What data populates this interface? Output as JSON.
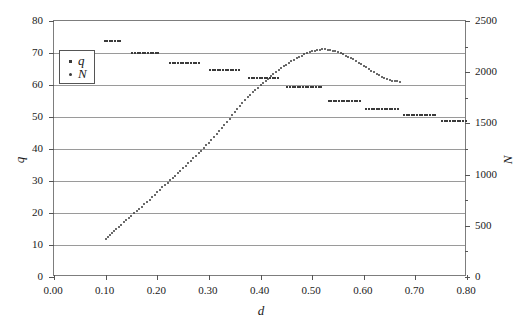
{
  "chart_data": {
    "type": "scatter",
    "title": "",
    "subtitle": "",
    "xlabel": "d",
    "ylabel": "q",
    "ylabel_right": "N",
    "xlim": [
      0.0,
      0.8
    ],
    "ylim": [
      0,
      80
    ],
    "ylim_right": [
      0,
      2500
    ],
    "grid": true,
    "legend_position": "top-left",
    "xticks": [
      "0.00",
      "0.10",
      "0.20",
      "0.30",
      "0.40",
      "0.50",
      "0.60",
      "0.70",
      "0.80"
    ],
    "xtick_values": [
      0.0,
      0.1,
      0.2,
      0.3,
      0.4,
      0.5,
      0.6,
      0.7,
      0.8
    ],
    "yticks_left": [
      "0",
      "10",
      "20",
      "30",
      "40",
      "50",
      "60",
      "70",
      "80"
    ],
    "ytick_values_left": [
      0,
      10,
      20,
      30,
      40,
      50,
      60,
      70,
      80
    ],
    "yticks_right": [
      "0",
      "500",
      "1000",
      "1500",
      "2000",
      "2500"
    ],
    "ytick_values_right": [
      0,
      500,
      1000,
      1500,
      2000,
      2500
    ],
    "ytick_minor_right": [
      250,
      750,
      1250,
      1750,
      2250
    ],
    "legend": [
      {
        "label": "q",
        "marker": "square",
        "axis": "left"
      },
      {
        "label": "N",
        "marker": "dot",
        "axis": "right"
      }
    ],
    "series": [
      {
        "name": "q",
        "marker": "dot",
        "axis": "left",
        "color": "#3a3a3a",
        "x": [
          0.1,
          0.104,
          0.108,
          0.112,
          0.116,
          0.12,
          0.125,
          0.13,
          0.135,
          0.14,
          0.145,
          0.15,
          0.155,
          0.16,
          0.165,
          0.17,
          0.175,
          0.18,
          0.185,
          0.19,
          0.195,
          0.2,
          0.205,
          0.21,
          0.215,
          0.22,
          0.225,
          0.23,
          0.235,
          0.24,
          0.245,
          0.25,
          0.255,
          0.26,
          0.265,
          0.27,
          0.275,
          0.28,
          0.285,
          0.29,
          0.295,
          0.3,
          0.305,
          0.31,
          0.315,
          0.32,
          0.325,
          0.33,
          0.335,
          0.34,
          0.345,
          0.35,
          0.355,
          0.36,
          0.365,
          0.37,
          0.375,
          0.38,
          0.385,
          0.39,
          0.395,
          0.4,
          0.405,
          0.41,
          0.415,
          0.42,
          0.425,
          0.43,
          0.435,
          0.44,
          0.445,
          0.45,
          0.455,
          0.46,
          0.465,
          0.47,
          0.475,
          0.48,
          0.485,
          0.49,
          0.495,
          0.5,
          0.505,
          0.51,
          0.515,
          0.52,
          0.525,
          0.53,
          0.535,
          0.54,
          0.545,
          0.55,
          0.555,
          0.56,
          0.565,
          0.57,
          0.575,
          0.58,
          0.585,
          0.59,
          0.595,
          0.6,
          0.605,
          0.61,
          0.615,
          0.62,
          0.625,
          0.63,
          0.635,
          0.64,
          0.645,
          0.65,
          0.655,
          0.66,
          0.665,
          0.67
        ],
        "y": [
          12.0,
          12.6,
          13.2,
          13.8,
          14.4,
          15.0,
          15.7,
          16.4,
          17.1,
          17.8,
          18.5,
          19.2,
          19.9,
          20.6,
          21.3,
          22.0,
          22.8,
          23.5,
          24.2,
          25.0,
          25.7,
          26.5,
          27.2,
          28.0,
          28.7,
          29.5,
          30.2,
          31.0,
          31.7,
          32.5,
          33.2,
          34.0,
          34.8,
          35.5,
          36.3,
          37.1,
          37.9,
          38.7,
          39.5,
          40.3,
          41.1,
          42.0,
          42.9,
          43.8,
          44.7,
          45.6,
          46.5,
          47.5,
          48.5,
          49.5,
          50.5,
          51.5,
          52.5,
          53.5,
          54.4,
          55.3,
          56.2,
          57.0,
          57.8,
          58.5,
          59.2,
          59.9,
          60.6,
          61.3,
          62.0,
          62.7,
          63.4,
          64.0,
          64.6,
          65.2,
          65.8,
          66.4,
          66.9,
          67.4,
          67.9,
          68.4,
          68.8,
          69.2,
          69.6,
          69.9,
          70.2,
          70.5,
          70.7,
          70.9,
          71.0,
          71.1,
          71.1,
          71.0,
          70.9,
          70.7,
          70.5,
          70.2,
          69.9,
          69.6,
          69.2,
          68.8,
          68.4,
          68.0,
          67.5,
          67.0,
          66.5,
          66.0,
          65.5,
          65.0,
          64.5,
          64.0,
          63.5,
          63.0,
          62.6,
          62.2,
          61.9,
          61.6,
          61.4,
          61.2,
          61.1,
          61.0
        ]
      },
      {
        "name": "N",
        "marker": "square",
        "axis": "right",
        "color": "#3a3a3a",
        "steps": [
          {
            "x_start": 0.098,
            "x_end": 0.133,
            "value": 2300
          },
          {
            "x_start": 0.152,
            "x_end": 0.205,
            "value": 2190
          },
          {
            "x_start": 0.225,
            "x_end": 0.285,
            "value": 2085
          },
          {
            "x_start": 0.302,
            "x_end": 0.362,
            "value": 2025
          },
          {
            "x_start": 0.378,
            "x_end": 0.438,
            "value": 1940
          },
          {
            "x_start": 0.452,
            "x_end": 0.52,
            "value": 1855
          },
          {
            "x_start": 0.532,
            "x_end": 0.595,
            "value": 1720
          },
          {
            "x_start": 0.605,
            "x_end": 0.668,
            "value": 1640
          },
          {
            "x_start": 0.678,
            "x_end": 0.742,
            "value": 1585
          },
          {
            "x_start": 0.752,
            "x_end": 0.812,
            "value": 1525
          },
          {
            "x_start": 0.826,
            "x_end": 0.89,
            "value": 1470
          },
          {
            "x_start": 0.9,
            "x_end": 0.962,
            "value": 1420
          }
        ]
      }
    ]
  }
}
